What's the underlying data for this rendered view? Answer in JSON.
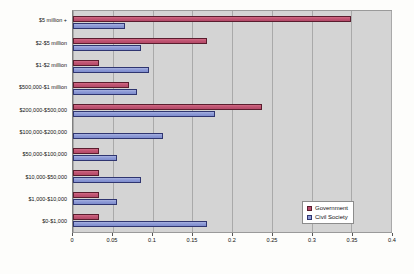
{
  "chart_data": {
    "type": "bar",
    "orientation": "horizontal",
    "title": "",
    "xlabel": "",
    "ylabel": "",
    "xlim": [
      0,
      0.4
    ],
    "xticks": [
      0,
      0.05,
      0.1,
      0.15,
      0.2,
      0.25,
      0.3,
      0.35,
      0.4
    ],
    "xtick_labels": [
      "0",
      "0.05",
      "0.1",
      "0.15",
      "0.2",
      "0.25",
      "0.3",
      "0.35",
      "0.4"
    ],
    "grid": true,
    "legend_position": "lower-right-inside",
    "categories": [
      "$5 million +",
      "$2-$5 million",
      "$1-$2 million",
      "$500,000-$1 million",
      "$200,000-$500,000",
      "$100,000-$200,000",
      "$50,000-$100,000",
      "$10,000-$50,000",
      "$1,000-$10,000",
      "$0-$1,000"
    ],
    "series": [
      {
        "name": "Government",
        "color": "#b94a6b",
        "values": [
          0.35,
          0.168,
          0.033,
          0.07,
          0.238,
          0.0,
          0.033,
          0.033,
          0.033,
          0.033
        ]
      },
      {
        "name": "Civil Society",
        "color": "#8d9ad6",
        "values": [
          0.066,
          0.085,
          0.095,
          0.08,
          0.178,
          0.113,
          0.055,
          0.085,
          0.055,
          0.168
        ]
      }
    ]
  },
  "legend": {
    "entries": [
      {
        "label": "Government"
      },
      {
        "label": "Civil Society"
      }
    ]
  }
}
